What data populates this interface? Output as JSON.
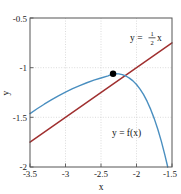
{
  "chart_data": {
    "type": "line",
    "title": "",
    "xlabel": "x",
    "ylabel": "y",
    "xlim": [
      -3.5,
      -1.5
    ],
    "ylim": [
      -2.0,
      -0.5
    ],
    "xticks": [
      -3.5,
      -3,
      -2.5,
      -2,
      -1.5
    ],
    "xtick_labels": [
      "-3.5",
      "-3",
      "-2.5",
      "-2",
      "-1.5"
    ],
    "yticks": [
      -0.5,
      -1,
      -1.5,
      -2
    ],
    "ytick_labels": [
      "-0.5",
      "-1",
      "-1.5",
      "-2"
    ],
    "grid": true,
    "grid_style": "dotted",
    "legend": "none",
    "series": [
      {
        "name": "y = f(x)",
        "type": "curve",
        "color": "#4a8fc0",
        "x": [
          -3.5,
          -3.4,
          -3.3,
          -3.2,
          -3.1,
          -3.0,
          -2.9,
          -2.8,
          -2.7,
          -2.6,
          -2.5,
          -2.4,
          -2.33,
          -2.25,
          -2.2,
          -2.15,
          -2.1,
          -2.05,
          -2.0,
          -1.95,
          -1.9,
          -1.85,
          -1.8,
          -1.75,
          -1.7,
          -1.65,
          -1.6,
          -1.56
        ],
        "y": [
          -1.462,
          -1.414,
          -1.368,
          -1.325,
          -1.284,
          -1.247,
          -1.212,
          -1.181,
          -1.152,
          -1.126,
          -1.104,
          -1.082,
          -1.061,
          -1.062,
          -1.07,
          -1.084,
          -1.105,
          -1.133,
          -1.17,
          -1.216,
          -1.272,
          -1.34,
          -1.42,
          -1.513,
          -1.62,
          -1.742,
          -1.88,
          -2.0
        ]
      },
      {
        "name": "y = (1/2)x",
        "type": "line",
        "color": "#a03030",
        "x": [
          -3.5,
          -1.5
        ],
        "y": [
          -1.75,
          -0.75
        ]
      }
    ],
    "points": [
      {
        "name": "tangency-point",
        "x": -2.33,
        "y": -1.061,
        "color": "#000000",
        "size": 3.2
      }
    ],
    "annotations": [
      {
        "name": "line-equation",
        "text_before": "y = ",
        "numerator": "1",
        "denominator": "2",
        "text_after": "x",
        "x": 148,
        "y": 38
      },
      {
        "name": "function-label",
        "text": "y = f(x)",
        "x": 130,
        "y": 133
      }
    ]
  }
}
